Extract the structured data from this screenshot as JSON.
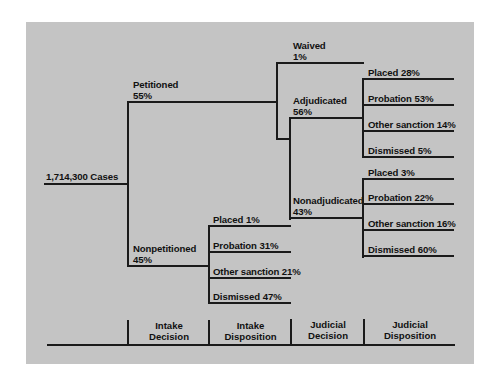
{
  "diagram": {
    "root": {
      "label": "1,714,300 Cases"
    },
    "intake_decision": [
      {
        "name": "Petitioned",
        "pct": "55%"
      },
      {
        "name": "Nonpetitioned",
        "pct": "45%"
      }
    ],
    "petitioned_judicial_decision": [
      {
        "name": "Waived",
        "pct": "1%"
      },
      {
        "name": "Adjudicated",
        "pct": "56%"
      },
      {
        "name": "Nonadjudicated",
        "pct": "43%"
      }
    ],
    "adjudicated_disposition": [
      {
        "label": "Placed 28%"
      },
      {
        "label": "Probation 53%"
      },
      {
        "label": "Other sanction 14%"
      },
      {
        "label": "Dismissed 5%"
      }
    ],
    "nonadjudicated_disposition": [
      {
        "label": "Placed 3%"
      },
      {
        "label": "Probation 22%"
      },
      {
        "label": "Other sanction 16%"
      },
      {
        "label": "Dismissed 60%"
      }
    ],
    "nonpetitioned_disposition": [
      {
        "label": "Placed 1%"
      },
      {
        "label": "Probation 31%"
      },
      {
        "label": "Other sanction 21%"
      },
      {
        "label": "Dismissed 47%"
      }
    ],
    "stages": [
      {
        "line1": "Intake",
        "line2": "Decision"
      },
      {
        "line1": "Intake",
        "line2": "Disposition"
      },
      {
        "line1": "Judicial",
        "line2": "Decision"
      },
      {
        "line1": "Judicial",
        "line2": "Disposition"
      }
    ]
  },
  "colors": {
    "panel": "#c4c4c4",
    "lines": "#1a1a1a",
    "text": "#111111"
  }
}
